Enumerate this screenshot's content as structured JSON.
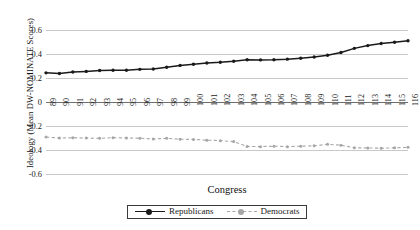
{
  "chart_data": {
    "type": "line",
    "title": "",
    "xlabel": "Congress",
    "ylabel": "Ideology (Mean DW-NOMINATE Scores)",
    "grid": true,
    "legend_position": "bottom-center",
    "ylim": [
      -0.6,
      0.6
    ],
    "yticks": [
      0.6,
      0.4,
      0.2,
      0,
      -0.2,
      -0.4,
      -0.6
    ],
    "ytick_labels": [
      "0.6",
      "0.4",
      "0.2",
      "0",
      "-0.2",
      "-0.4",
      "-0.6"
    ],
    "categories": [
      "89",
      "90",
      "91",
      "92",
      "93",
      "94",
      "95",
      "96",
      "97",
      "98",
      "99",
      "100",
      "101",
      "102",
      "103",
      "104",
      "105",
      "106",
      "107",
      "108",
      "109",
      "110",
      "111",
      "112",
      "113",
      "114",
      "115",
      "116"
    ],
    "series": [
      {
        "name": "Republicans",
        "color": "#1a1a1a",
        "marker": "filled-circle",
        "linestyle": "solid",
        "values": [
          0.243,
          0.238,
          0.25,
          0.255,
          0.262,
          0.264,
          0.265,
          0.272,
          0.275,
          0.289,
          0.305,
          0.315,
          0.325,
          0.331,
          0.34,
          0.352,
          0.351,
          0.352,
          0.357,
          0.365,
          0.375,
          0.39,
          0.412,
          0.447,
          0.47,
          0.487,
          0.498,
          0.51
        ]
      },
      {
        "name": "Democrats",
        "color": "#a6a6a6",
        "marker": "filled-circle",
        "linestyle": "dashed",
        "values": [
          -0.292,
          -0.3,
          -0.298,
          -0.3,
          -0.303,
          -0.297,
          -0.3,
          -0.302,
          -0.308,
          -0.303,
          -0.31,
          -0.312,
          -0.318,
          -0.322,
          -0.33,
          -0.37,
          -0.372,
          -0.368,
          -0.372,
          -0.368,
          -0.365,
          -0.352,
          -0.36,
          -0.382,
          -0.383,
          -0.385,
          -0.382,
          -0.378
        ]
      }
    ],
    "legend": [
      {
        "label": "Republicans",
        "color": "#1a1a1a",
        "linestyle": "solid"
      },
      {
        "label": "Democrats",
        "color": "#a6a6a6",
        "linestyle": "dashed"
      }
    ]
  }
}
